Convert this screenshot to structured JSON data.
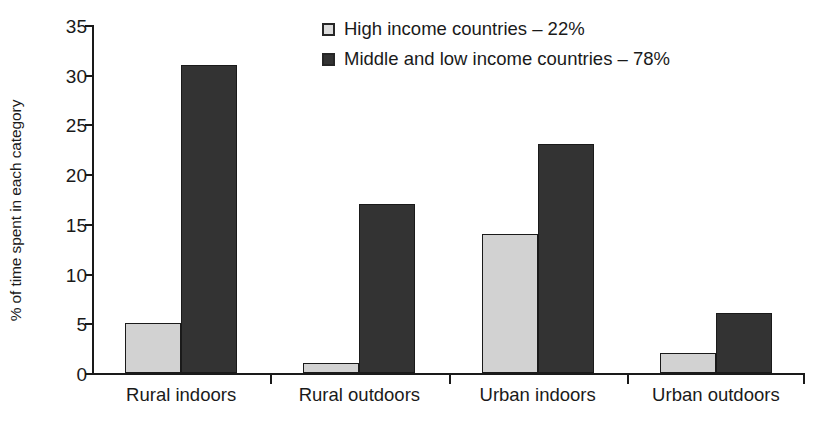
{
  "chart_data": {
    "type": "bar",
    "title": "",
    "xlabel": "",
    "ylabel": "% of time spent in each category",
    "ylim": [
      0,
      35
    ],
    "ytick_labels": [
      "0",
      "5",
      "10",
      "15",
      "20",
      "25",
      "30",
      "35"
    ],
    "yticks": [
      0,
      5,
      10,
      15,
      20,
      25,
      30,
      35
    ],
    "grid": false,
    "legend_position": "top-center",
    "categories": [
      "Rural indoors",
      "Rural outdoors",
      "Urban indoors",
      "Urban outdoors"
    ],
    "series": [
      {
        "name": "High income countries – 22%",
        "color": "#d2d2d2",
        "values": [
          5,
          1,
          14,
          2
        ]
      },
      {
        "name": "Middle and low income countries – 78%",
        "color": "#333333",
        "values": [
          31,
          17,
          23,
          6
        ]
      }
    ]
  },
  "legend": {
    "items": [
      {
        "label": "High income countries – 22%",
        "swatch": "light"
      },
      {
        "label": "Middle and low income countries – 78%",
        "swatch": "dark"
      }
    ]
  }
}
